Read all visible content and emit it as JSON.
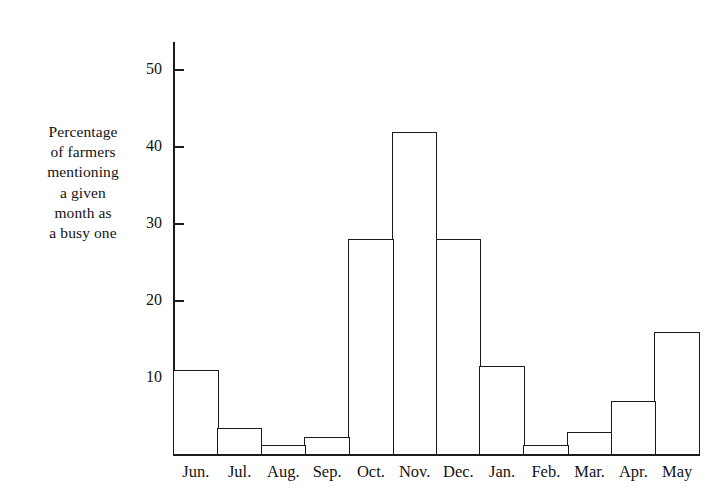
{
  "chart_data": {
    "type": "bar",
    "title": "",
    "subtitle": "",
    "xlabel": "",
    "ylabel": "Percentage of farmers mentioning a given month as a busy one",
    "ylabel_lines": [
      "Percentage",
      "of farmers",
      "mentioning",
      "a given",
      "month as",
      "a busy one"
    ],
    "categories": [
      "Jun.",
      "Jul.",
      "Aug.",
      "Sep.",
      "Oct.",
      "Nov.",
      "Dec.",
      "Jan.",
      "Feb.",
      "Mar.",
      "Apr.",
      "May"
    ],
    "values": [
      11,
      3.5,
      1.3,
      2.3,
      28,
      42,
      28,
      11.5,
      1.3,
      3,
      7,
      16
    ],
    "ytick_labels": [
      "10",
      "20",
      "30",
      "40",
      "50"
    ],
    "ytick_values": [
      10,
      20,
      30,
      40,
      50
    ],
    "ylim": [
      0,
      53.5
    ],
    "grid": false,
    "legend": false,
    "legend_position": "none",
    "bar_style": "contiguous-outline",
    "colors": {
      "bar_fill": "#ffffff",
      "bar_outline": "#1b1b1b",
      "axis": "#1b1b1b",
      "text": "#131313",
      "background": "#ffffff"
    }
  }
}
